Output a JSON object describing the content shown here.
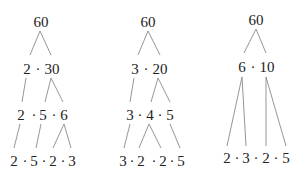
{
  "trees": [
    {
      "name": "tree-1",
      "levels": [
        [
          "60"
        ],
        [
          "2",
          "·",
          "30"
        ],
        [
          "2",
          "·",
          "5",
          "·",
          "6"
        ],
        [
          "2",
          "·",
          "5",
          "·",
          "2",
          "·",
          "3"
        ]
      ]
    },
    {
      "name": "tree-2",
      "levels": [
        [
          "60"
        ],
        [
          "3",
          "·",
          "20"
        ],
        [
          "3",
          "·",
          "4",
          "·",
          "5"
        ],
        [
          "3",
          "·",
          "2",
          "·",
          "2",
          "·",
          "5"
        ]
      ]
    },
    {
      "name": "tree-3",
      "levels": [
        [
          "60"
        ],
        [
          "6",
          "·",
          "10"
        ],
        [
          "2",
          "·",
          "3",
          "·",
          "2",
          "·",
          "5"
        ]
      ]
    }
  ]
}
